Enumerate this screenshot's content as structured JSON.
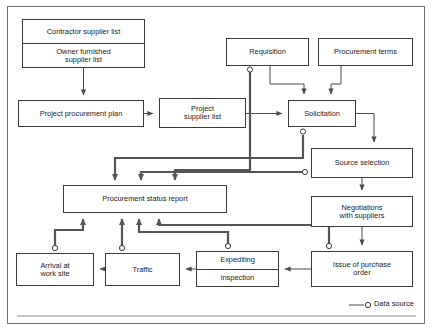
{
  "diagram": {
    "legend": {
      "symbol": "data-source-circle",
      "label": "Data source"
    },
    "colors": {
      "box_border": "#3a3a3a",
      "frame_border": "#6e6e6e",
      "thin_line": "#4a4a4a",
      "thick_line": "#555555",
      "text": "#1a1a1a",
      "background": "#ffffff"
    },
    "nodes": [
      {
        "id": "contractor-owner-list",
        "lines": [
          "Contractor supplier list",
          "Owner furnished",
          "supplier list"
        ],
        "cells": [
          {
            "text": "Contractor supplier list"
          },
          {
            "text": "Owner furnished\nsupplier list"
          }
        ],
        "x": 22,
        "y": 19,
        "w": 123,
        "h": 49,
        "split": true
      },
      {
        "id": "requisition",
        "cells": [
          {
            "text": "Requisition"
          }
        ],
        "x": 226,
        "y": 38,
        "w": 83,
        "h": 28,
        "split": false
      },
      {
        "id": "procurement-terms",
        "cells": [
          {
            "text": "Procurement terms"
          }
        ],
        "x": 318,
        "y": 38,
        "w": 95,
        "h": 28,
        "split": false
      },
      {
        "id": "project-procurement-plan",
        "cells": [
          {
            "text": "Project procurement plan"
          }
        ],
        "x": 18,
        "y": 100,
        "w": 126,
        "h": 27,
        "split": false
      },
      {
        "id": "project-supplier-list",
        "cells": [
          {
            "text": "Project\nsupplier list"
          }
        ],
        "x": 159,
        "y": 98,
        "w": 87,
        "h": 30,
        "split": false
      },
      {
        "id": "solicitation",
        "cells": [
          {
            "text": "Solicitation"
          }
        ],
        "x": 288,
        "y": 100,
        "w": 68,
        "h": 27,
        "split": false
      },
      {
        "id": "source-selection",
        "cells": [
          {
            "text": "Source selection"
          }
        ],
        "x": 311,
        "y": 148,
        "w": 102,
        "h": 30,
        "split": false
      },
      {
        "id": "procurement-status-report",
        "cells": [
          {
            "text": "Procurement status report"
          }
        ],
        "x": 63,
        "y": 185,
        "w": 164,
        "h": 28,
        "split": false
      },
      {
        "id": "negotiations-with-suppliers",
        "cells": [
          {
            "text": "Negotiations\nwith suppliers"
          }
        ],
        "x": 311,
        "y": 196,
        "w": 102,
        "h": 31,
        "split": false
      },
      {
        "id": "arrival-at-work-site",
        "cells": [
          {
            "text": "Arrival at\nwork site"
          }
        ],
        "x": 16,
        "y": 253,
        "w": 78,
        "h": 33,
        "split": false
      },
      {
        "id": "traffic",
        "cells": [
          {
            "text": "Traffic"
          }
        ],
        "x": 105,
        "y": 253,
        "w": 75,
        "h": 33,
        "split": false
      },
      {
        "id": "expediting-inspection",
        "cells": [
          {
            "text": "Expediting"
          },
          {
            "text": "inspection"
          }
        ],
        "x": 196,
        "y": 251,
        "w": 83,
        "h": 36,
        "split": true
      },
      {
        "id": "issue-of-purchase-order",
        "cells": [
          {
            "text": "Issue of purchase\norder"
          }
        ],
        "x": 311,
        "y": 251,
        "w": 102,
        "h": 36,
        "split": false
      }
    ],
    "data_source_markers": [
      {
        "for": "requisition",
        "cx": 250,
        "cy": 69
      },
      {
        "for": "solicitation",
        "cx": 303,
        "cy": 131
      },
      {
        "for": "source-selection",
        "cx": 306,
        "cy": 172
      },
      {
        "for": "arrival-at-work-site",
        "cx": 55,
        "cy": 249
      },
      {
        "for": "traffic",
        "cx": 122,
        "cy": 249
      },
      {
        "for": "expediting-inspection",
        "cx": 228,
        "cy": 247
      },
      {
        "for": "issue-of-purchase-order",
        "cx": 329,
        "cy": 247
      }
    ],
    "edges": [
      {
        "from": "contractor-owner-list",
        "to": "project-procurement-plan",
        "weight": "thin"
      },
      {
        "from": "project-procurement-plan",
        "to": "project-supplier-list",
        "weight": "thin"
      },
      {
        "from": "project-supplier-list",
        "to": "solicitation",
        "weight": "thin"
      },
      {
        "from": "requisition",
        "to": "solicitation",
        "weight": "thin"
      },
      {
        "from": "procurement-terms",
        "to": "solicitation",
        "weight": "thin"
      },
      {
        "from": "solicitation",
        "to": "source-selection",
        "weight": "thin"
      },
      {
        "from": "source-selection",
        "to": "negotiations-with-suppliers",
        "weight": "thin"
      },
      {
        "from": "negotiations-with-suppliers",
        "to": "issue-of-purchase-order",
        "weight": "thin"
      },
      {
        "from": "issue-of-purchase-order",
        "to": "expediting-inspection",
        "weight": "thin"
      },
      {
        "from": "expediting-inspection",
        "to": "traffic",
        "weight": "thin"
      },
      {
        "from": "traffic",
        "to": "arrival-at-work-site",
        "weight": "thin"
      },
      {
        "from": "requisition",
        "to": "procurement-status-report",
        "weight": "thick"
      },
      {
        "from": "solicitation",
        "to": "procurement-status-report",
        "weight": "thick"
      },
      {
        "from": "source-selection",
        "to": "procurement-status-report",
        "weight": "thick"
      },
      {
        "from": "arrival-at-work-site",
        "to": "procurement-status-report",
        "weight": "thick"
      },
      {
        "from": "traffic",
        "to": "procurement-status-report",
        "weight": "thick"
      },
      {
        "from": "expediting-inspection",
        "to": "procurement-status-report",
        "weight": "thick"
      },
      {
        "from": "issue-of-purchase-order",
        "to": "procurement-status-report",
        "weight": "thick"
      }
    ]
  }
}
